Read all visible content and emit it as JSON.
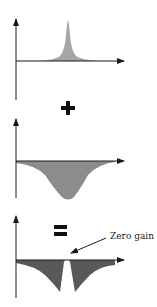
{
  "diagram": {
    "panels": [
      {
        "id": "peak",
        "description": "positive narrow resonance peak"
      },
      {
        "id": "dip",
        "description": "negative broad dip"
      },
      {
        "id": "sum",
        "description": "resulting dip with zero-gain notch"
      }
    ],
    "operators": {
      "plus": "+",
      "equals": "="
    },
    "annotation": {
      "text": "Zero gain"
    },
    "colors": {
      "fill_light": "#a6a6a6",
      "fill_medium": "#8c8c8c",
      "fill_dark": "#595959",
      "axis": "#1a1a1a"
    }
  }
}
